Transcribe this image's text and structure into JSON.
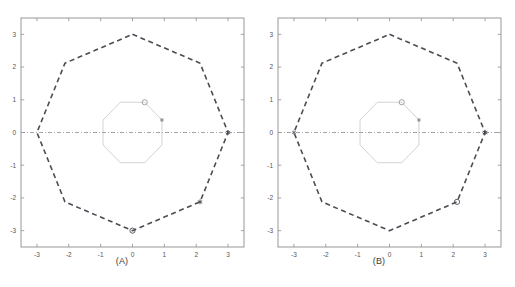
{
  "figure": {
    "background": "#ffffff",
    "panels": [
      {
        "id": "panel-a",
        "caption": "(A)",
        "axes": {
          "xlim": [
            -3.5,
            3.5
          ],
          "ylim": [
            -3.5,
            3.5
          ],
          "xticks": [
            -3,
            -2,
            -1,
            0,
            1,
            2,
            3
          ],
          "yticks": [
            -3,
            -2,
            -1,
            0,
            1,
            2,
            3
          ],
          "xticklabels": [
            "-3",
            "-2",
            "-1",
            "0",
            "1",
            "2",
            "3"
          ],
          "yticklabels": [
            "-3",
            "-2",
            "-1",
            "0",
            "1",
            "2",
            "3"
          ],
          "box": true,
          "grid": false,
          "frame_color": "#8d8d93",
          "tick_color": "#8d8d93",
          "label_color": "#55545a"
        },
        "series": [
          {
            "name": "outer-polygon",
            "style": "dashed",
            "color": "#4c4c55",
            "linewidth": 1.6,
            "closed": true,
            "points": [
              [
                0,
                3
              ],
              [
                2.12,
                2.12
              ],
              [
                3,
                0
              ],
              [
                2.12,
                -2.12
              ],
              [
                0,
                -3
              ],
              [
                -2.12,
                -2.12
              ],
              [
                -3,
                0
              ],
              [
                -2.12,
                2.12
              ]
            ]
          },
          {
            "name": "inner-polygon",
            "style": "solid",
            "color": "#c3c6c9",
            "linewidth": 0.8,
            "closed": true,
            "points": [
              [
                0.924,
                0.383
              ],
              [
                0.383,
                0.924
              ],
              [
                -0.383,
                0.924
              ],
              [
                -0.924,
                0.383
              ],
              [
                -0.924,
                -0.383
              ],
              [
                -0.383,
                -0.924
              ],
              [
                0.383,
                -0.924
              ],
              [
                0.924,
                -0.383
              ]
            ]
          },
          {
            "name": "horizontal-axis-line",
            "style": "dashdot",
            "color": "#9a9aa2",
            "linewidth": 0.9,
            "closed": false,
            "points": [
              [
                -3.5,
                0
              ],
              [
                3.5,
                0
              ]
            ]
          }
        ],
        "markers": [
          {
            "name": "marker-circle-inner",
            "shape": "circle",
            "x": 0.383,
            "y": 0.924,
            "size": 5.2,
            "color": "#9b9ba3"
          },
          {
            "name": "marker-star-inner",
            "shape": "asterisk",
            "x": 0.924,
            "y": 0.383,
            "size": 4.0,
            "color": "#8b8b93"
          },
          {
            "name": "marker-star-right",
            "shape": "asterisk",
            "x": 3.0,
            "y": 0.0,
            "size": 5.0,
            "color": "#4c4c55"
          },
          {
            "name": "marker-star-lower-right",
            "shape": "asterisk",
            "x": 2.12,
            "y": -2.12,
            "size": 5.0,
            "color": "#4c4c55"
          },
          {
            "name": "marker-circle-bottom",
            "shape": "circle",
            "x": 0.0,
            "y": -3.0,
            "size": 5.2,
            "color": "#4c4c55"
          }
        ]
      },
      {
        "id": "panel-b",
        "caption": "(B)",
        "axes": {
          "xlim": [
            -3.5,
            3.5
          ],
          "ylim": [
            -3.5,
            3.5
          ],
          "xticks": [
            -3,
            -2,
            -1,
            0,
            1,
            2,
            3
          ],
          "yticks": [
            -3,
            -2,
            -1,
            0,
            1,
            2,
            3
          ],
          "xticklabels": [
            "-3",
            "-2",
            "-1",
            "0",
            "1",
            "2",
            "3"
          ],
          "yticklabels": [
            "-3",
            "-2",
            "-1",
            "0",
            "1",
            "2",
            "3"
          ],
          "box": true,
          "grid": false,
          "frame_color": "#8d8d93",
          "tick_color": "#8d8d93",
          "label_color": "#55545a"
        },
        "series": [
          {
            "name": "outer-polygon",
            "style": "dashed",
            "color": "#4c4c55",
            "linewidth": 1.6,
            "closed": true,
            "points": [
              [
                0,
                3
              ],
              [
                2.12,
                2.12
              ],
              [
                3,
                0
              ],
              [
                2.12,
                -2.12
              ],
              [
                0,
                -3
              ],
              [
                -2.12,
                -2.12
              ],
              [
                -3,
                0
              ],
              [
                -2.12,
                2.12
              ]
            ]
          },
          {
            "name": "inner-polygon",
            "style": "solid",
            "color": "#c3c6c9",
            "linewidth": 0.8,
            "closed": true,
            "points": [
              [
                0.924,
                0.383
              ],
              [
                0.383,
                0.924
              ],
              [
                -0.383,
                0.924
              ],
              [
                -0.924,
                0.383
              ],
              [
                -0.924,
                -0.383
              ],
              [
                -0.383,
                -0.924
              ],
              [
                0.383,
                -0.924
              ],
              [
                0.924,
                -0.383
              ]
            ]
          },
          {
            "name": "horizontal-axis-line",
            "style": "dashdot",
            "color": "#9a9aa2",
            "linewidth": 0.9,
            "closed": false,
            "points": [
              [
                -3.5,
                0
              ],
              [
                3.5,
                0
              ]
            ]
          }
        ],
        "markers": [
          {
            "name": "marker-circle-inner",
            "shape": "circle",
            "x": 0.383,
            "y": 0.924,
            "size": 5.2,
            "color": "#9b9ba3"
          },
          {
            "name": "marker-star-inner",
            "shape": "asterisk",
            "x": 0.924,
            "y": 0.383,
            "size": 4.0,
            "color": "#8b8b93"
          },
          {
            "name": "marker-star-right",
            "shape": "asterisk",
            "x": 3.0,
            "y": 0.0,
            "size": 5.4,
            "color": "#3d3d46"
          },
          {
            "name": "marker-star-left",
            "shape": "asterisk",
            "x": -3.0,
            "y": 0.0,
            "size": 4.2,
            "color": "#6a6a73"
          },
          {
            "name": "marker-circle-lower-right",
            "shape": "circle",
            "x": 2.12,
            "y": -2.12,
            "size": 5.2,
            "color": "#4c4c55"
          }
        ]
      }
    ]
  },
  "chart_data": {
    "type": "line",
    "title": "",
    "xlabel": "",
    "ylabel": "",
    "xlim": [
      -3.5,
      3.5
    ],
    "ylim": [
      -3.5,
      3.5
    ],
    "grid": false,
    "legend": "none",
    "subplots": [
      {
        "label": "(A)",
        "xticks": [
          -3,
          -2,
          -1,
          0,
          1,
          2,
          3
        ],
        "yticks": [
          -3,
          -2,
          -1,
          0,
          1,
          2,
          3
        ],
        "series": [
          {
            "name": "outer octagon (dashed)",
            "x": [
              0,
              2.12,
              3,
              2.12,
              0,
              -2.12,
              -3,
              -2.12,
              0
            ],
            "y": [
              3,
              2.12,
              0,
              -2.12,
              -3,
              -2.12,
              0,
              2.12,
              3
            ]
          },
          {
            "name": "inner octagon (solid, radius 1)",
            "x": [
              0.924,
              0.383,
              -0.383,
              -0.924,
              -0.924,
              -0.383,
              0.383,
              0.924,
              0.924
            ],
            "y": [
              0.383,
              0.924,
              0.924,
              0.383,
              -0.383,
              -0.924,
              -0.924,
              -0.383,
              0.383
            ]
          },
          {
            "name": "real axis (dash-dot)",
            "x": [
              -3.5,
              3.5
            ],
            "y": [
              0,
              0
            ]
          }
        ],
        "marked_points": [
          {
            "marker": "o",
            "x": 0.38,
            "y": 0.92
          },
          {
            "marker": "*",
            "x": 0.92,
            "y": 0.38
          },
          {
            "marker": "*",
            "x": 3.0,
            "y": 0.0
          },
          {
            "marker": "*",
            "x": 2.12,
            "y": -2.12
          },
          {
            "marker": "o",
            "x": 0.0,
            "y": -3.0
          }
        ]
      },
      {
        "label": "(B)",
        "xticks": [
          -3,
          -2,
          -1,
          0,
          1,
          2,
          3
        ],
        "yticks": [
          -3,
          -2,
          -1,
          0,
          1,
          2,
          3
        ],
        "series": [
          {
            "name": "outer octagon (dashed)",
            "x": [
              0,
              2.12,
              3,
              2.12,
              0,
              -2.12,
              -3,
              -2.12,
              0
            ],
            "y": [
              3,
              2.12,
              0,
              -2.12,
              -3,
              -2.12,
              0,
              2.12,
              3
            ]
          },
          {
            "name": "inner octagon (solid, radius 1)",
            "x": [
              0.924,
              0.383,
              -0.383,
              -0.924,
              -0.924,
              -0.383,
              0.383,
              0.924,
              0.924
            ],
            "y": [
              0.383,
              0.924,
              0.924,
              0.383,
              -0.383,
              -0.924,
              -0.924,
              -0.383,
              0.383
            ]
          },
          {
            "name": "real axis (dash-dot)",
            "x": [
              -3.5,
              3.5
            ],
            "y": [
              0,
              0
            ]
          }
        ],
        "marked_points": [
          {
            "marker": "o",
            "x": 0.38,
            "y": 0.92
          },
          {
            "marker": "*",
            "x": 0.92,
            "y": 0.38
          },
          {
            "marker": "*",
            "x": 3.0,
            "y": 0.0
          },
          {
            "marker": "*",
            "x": -3.0,
            "y": 0.0
          },
          {
            "marker": "o",
            "x": 2.12,
            "y": -2.12
          }
        ]
      }
    ]
  }
}
